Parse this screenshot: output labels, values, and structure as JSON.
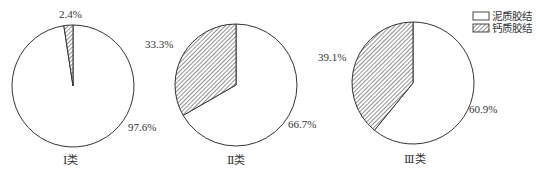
{
  "chart_data": [
    {
      "type": "pie",
      "title": "Ⅰ类",
      "slices": [
        {
          "label": "泥质胶结",
          "value": 97.6,
          "display": "97.6%"
        },
        {
          "label": "钙质胶结",
          "value": 2.4,
          "display": "2.4%"
        }
      ]
    },
    {
      "type": "pie",
      "title": "Ⅱ类",
      "slices": [
        {
          "label": "泥质胶结",
          "value": 66.7,
          "display": "66.7%"
        },
        {
          "label": "钙质胶结",
          "value": 33.3,
          "display": "33.3%"
        }
      ]
    },
    {
      "type": "pie",
      "title": "Ⅲ类",
      "slices": [
        {
          "label": "泥质胶结",
          "value": 60.9,
          "display": "60.9%"
        },
        {
          "label": "钙质胶结",
          "value": 39.1,
          "display": "39.1%"
        }
      ]
    }
  ],
  "legend": {
    "position": "top-right",
    "items": [
      {
        "label": "泥质胶结",
        "fill": "white"
      },
      {
        "label": "钙质胶结",
        "fill": "hatched"
      }
    ]
  },
  "colors": {
    "outline": "#333333",
    "hatch": "#555555",
    "background": "#ffffff"
  }
}
